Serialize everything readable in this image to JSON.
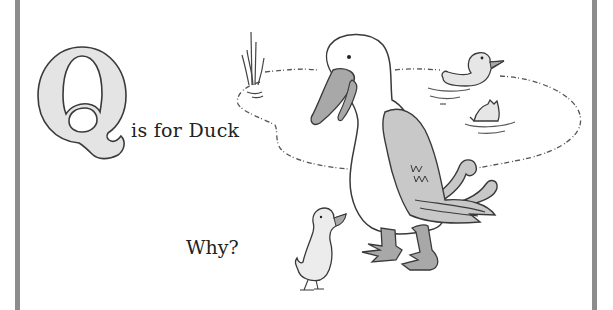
{
  "page": {
    "letter": "Q",
    "caption": "is for Duck",
    "question": "Why?"
  },
  "illustration": {
    "subjects": [
      "big-duck",
      "duckling",
      "swimming-duck",
      "diving-duck",
      "pond",
      "reeds"
    ],
    "colors": {
      "border": "#8c8c8c",
      "letter_fill": "#e4e4e4",
      "outline": "#3a3a3a",
      "wing_fill": "#c8c8c8",
      "beak_fill": "#a8a8a8",
      "feet_fill": "#a8a8a8"
    }
  }
}
